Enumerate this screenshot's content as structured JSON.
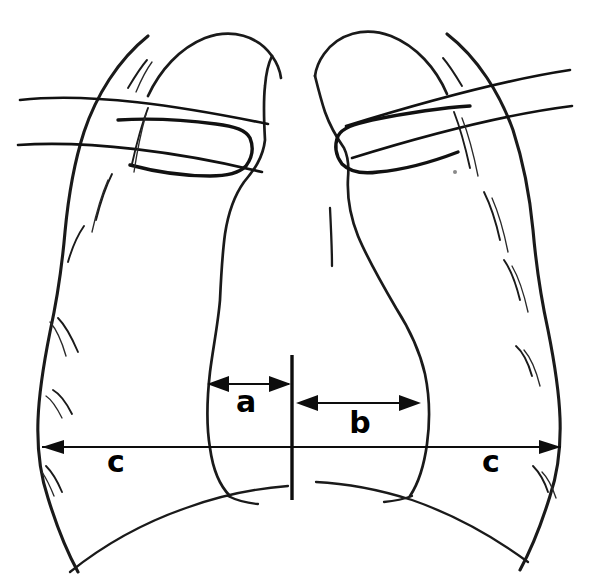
{
  "figure": {
    "name": "chest-radiograph-cardiothoracic-ratio-schematic",
    "background_color": "#ffffff",
    "ink_color": "#1a1a1a",
    "width": 590,
    "height": 588
  },
  "measurements": {
    "a": {
      "label": "a",
      "label_x": 246,
      "label_y": 402,
      "arrow_y": 384,
      "x_start": 208,
      "x_end": 291,
      "double_headed": true
    },
    "b": {
      "label": "b",
      "label_x": 360,
      "label_y": 424,
      "arrow_y": 403,
      "x_start": 296,
      "x_end": 421,
      "double_headed": true
    },
    "c_left": {
      "label": "c",
      "label_x": 116,
      "label_y": 463,
      "arrow_y": 447,
      "x_start": 42,
      "x_end": 292,
      "double_headed": false
    },
    "c_right": {
      "label": "c",
      "label_x": 491,
      "label_y": 463,
      "arrow_y": 447,
      "x_start": 292,
      "x_end": 561,
      "double_headed": false
    }
  },
  "midline": {
    "name": "vertical-midline",
    "x": 292,
    "y_top": 355,
    "y_bottom": 500
  },
  "anatomy": {
    "left_chest_wall": {
      "name": "left-chest-wall-outline",
      "path": "M 148 36 C 118 60 96 96 84 132 C 73 166 68 200 65 232 C 62 266 57 300 50 332 C 44 362 39 392 38 420 C 37 448 40 474 48 498 C 56 524 66 550 78 572"
    },
    "left_lung_apex": {
      "name": "left-lung-apex-arc",
      "path": "M 148 96 C 160 70 180 48 205 38 C 232 28 258 36 272 56 C 277 63 280 70 281 78"
    },
    "right_chest_wall": {
      "name": "right-chest-wall-outline",
      "path": "M 447 34 C 478 58 500 94 513 130 C 524 164 530 198 533 230 C 536 264 541 298 548 330 C 554 360 559 390 560 418 C 561 446 558 472 550 496 C 542 522 532 548 520 570"
    },
    "right_lung_apex": {
      "name": "right-lung-apex-arc",
      "path": "M 447 94 C 436 68 416 46 391 36 C 364 26 338 34 324 54 C 319 61 316 68 315 76"
    },
    "mediastinum_left_border": {
      "name": "cardiac-left-border",
      "path": "M 272 56 C 268 64 266 74 265 86 C 263 104 264 122 265 140 C 263 158 254 170 244 182 C 234 196 228 214 225 234 C 222 256 221 278 220 300 C 218 324 213 348 210 372 C 207 398 206 424 210 448 C 213 470 220 486 230 496"
    },
    "cardiac_right_border": {
      "name": "cardiac-right-border",
      "path": "M 315 76 C 318 88 321 100 325 112 C 330 126 337 138 344 148 C 348 156 349 166 348 178 C 347 196 350 216 358 236 C 368 260 382 284 396 308 C 410 330 420 352 425 374 C 430 398 430 422 427 444 C 424 466 418 484 410 496"
    },
    "cardiac_notch_tick": {
      "name": "cardiac-notch-tick",
      "path": "M 330 208 C 331 228 332 248 332 266"
    },
    "left_hemidiaphragm": {
      "name": "left-hemidiaphragm",
      "path": "M 70 572 C 100 548 140 524 186 508 C 224 494 262 488 288 486"
    },
    "right_hemidiaphragm": {
      "name": "right-hemidiaphragm",
      "path": "M 528 562 C 498 540 458 516 412 500 C 374 488 338 483 316 482"
    },
    "left_costophrenic_drop": {
      "name": "left-costophrenic-angle",
      "path": "M 228 496 C 236 500 246 503 258 504"
    },
    "right_costophrenic_drop": {
      "name": "right-costophrenic-angle",
      "path": "M 412 496 C 404 499 394 501 384 502"
    },
    "clavicle_left": {
      "name": "left-clavicle",
      "path": "M 118 120 C 150 118 186 120 216 124 C 234 126 246 130 250 138 C 254 148 252 158 246 166 C 238 174 224 176 210 176 C 186 176 156 172 130 165"
    },
    "clavicle_right": {
      "name": "right-clavicle",
      "path": "M 470 106 C 438 108 402 114 372 120 C 354 124 342 128 338 136 C 334 146 336 156 342 164 C 350 172 364 174 378 172 C 402 170 432 162 458 152"
    },
    "rib_left_upper": {
      "name": "left-posterior-rib-upper",
      "path": "M 20 100 C 90 92 180 106 268 124"
    },
    "rib_left_lower": {
      "name": "left-posterior-rib-lower",
      "path": "M 18 145 C 88 140 180 152 262 172"
    },
    "rib_right_upper": {
      "name": "right-posterior-rib-upper",
      "path": "M 570 70 C 504 80 430 100 346 126"
    },
    "rib_right_lower": {
      "name": "right-posterior-rib-lower",
      "path": "M 572 106 C 508 114 436 132 352 158"
    },
    "hatches": {
      "name": "rib-end-hatch-marks",
      "count": 14
    },
    "speck": {
      "name": "scan-speck-artifact",
      "x": 455,
      "y": 172
    }
  }
}
